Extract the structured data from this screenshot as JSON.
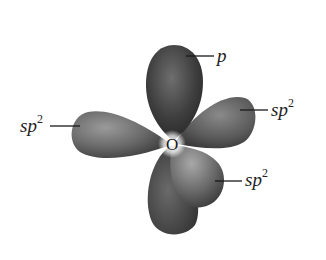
{
  "diagram": {
    "atom": {
      "symbol": "O"
    },
    "orbitals": [
      {
        "id": "p",
        "type": "p",
        "direction": "up"
      },
      {
        "id": "sp2-left",
        "type": "sp2",
        "direction": "left"
      },
      {
        "id": "sp2-right",
        "type": "sp2",
        "direction": "upper-right"
      },
      {
        "id": "sp2-lower",
        "type": "sp2",
        "direction": "lower-right"
      }
    ],
    "labels": {
      "p": {
        "base": "p",
        "sup": ""
      },
      "sp2_right": {
        "base": "sp",
        "sup": "2"
      },
      "sp2_left": {
        "base": "sp",
        "sup": "2"
      },
      "sp2_lower": {
        "base": "sp",
        "sup": "2"
      }
    },
    "colors": {
      "lobe_dark": "#2e2e2e",
      "lobe_mid": "#6a6a6a",
      "lobe_light": "#9a9a9a",
      "leader_line": "#1a1a1a",
      "background": "#ffffff"
    }
  }
}
